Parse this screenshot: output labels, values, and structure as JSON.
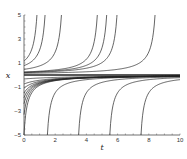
{
  "chart_data": {
    "type": "line",
    "title": "",
    "xlabel": "t",
    "ylabel": "x",
    "xlim": [
      0,
      10
    ],
    "ylim": [
      -5,
      5
    ],
    "x_ticks": [
      0,
      2,
      4,
      6,
      8,
      10
    ],
    "y_ticks": [
      -5,
      -3,
      -1,
      1,
      3,
      5
    ],
    "grid": false,
    "legend": null,
    "line_color": "#222222",
    "series": [
      {
        "name": "upper x0=2",
        "branch": "upper",
        "blowup_t": 0.83
      },
      {
        "name": "upper x0=1",
        "branch": "upper",
        "blowup_t": 1.35
      },
      {
        "name": "upper x0=0.5",
        "branch": "upper",
        "blowup_t": 2.4
      },
      {
        "name": "upper near zero 1",
        "branch": "upper",
        "blowup_t": 4.7
      },
      {
        "name": "upper near zero 2",
        "branch": "upper",
        "blowup_t": 5.3
      },
      {
        "name": "upper near zero 3",
        "branch": "upper",
        "blowup_t": 5.96
      },
      {
        "name": "upper near zero 4",
        "branch": "upper",
        "blowup_t": 8.4
      },
      {
        "name": "equilibrium x=0",
        "branch": "zero"
      },
      {
        "name": "lower x0=-0.33",
        "branch": "lower",
        "t0": 0,
        "x0": -0.33
      },
      {
        "name": "lower x0=-0.75",
        "branch": "lower",
        "t0": 0,
        "x0": -0.75
      },
      {
        "name": "lower x0=-1.1",
        "branch": "lower",
        "t0": 0,
        "x0": -1.1
      },
      {
        "name": "lower x0=-1.5",
        "branch": "lower",
        "t0": 0,
        "x0": -1.5
      },
      {
        "name": "lower x0=-1.9",
        "branch": "lower",
        "t0": 0,
        "x0": -1.9
      },
      {
        "name": "lower x0=-2.4",
        "branch": "lower",
        "t0": 0,
        "x0": -2.4
      },
      {
        "name": "lower x0=-3.3",
        "branch": "lower",
        "t0": 0,
        "x0": -3.3
      },
      {
        "name": "lower x0=-5",
        "branch": "lower",
        "t0": 0,
        "x0": -5
      },
      {
        "name": "lower from t=1.5",
        "branch": "lower",
        "t0": 1.5,
        "x0": -5
      },
      {
        "name": "lower from t=3.5",
        "branch": "lower",
        "t0": 3.5,
        "x0": -5
      },
      {
        "name": "lower from t=5.5",
        "branch": "lower",
        "t0": 5.5,
        "x0": -5
      },
      {
        "name": "lower from t=7.5",
        "branch": "lower",
        "t0": 7.5,
        "x0": -5
      }
    ]
  }
}
